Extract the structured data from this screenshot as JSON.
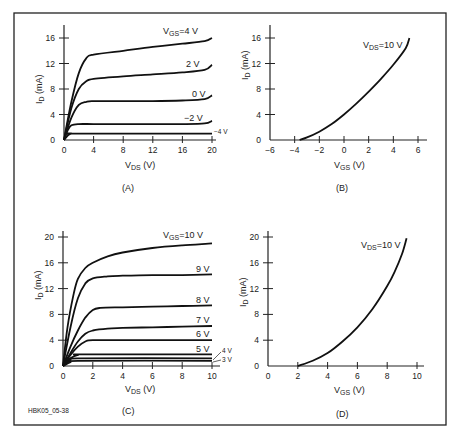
{
  "figure": {
    "credit": "HBK05_05-38",
    "border_color": "#222222"
  },
  "chart_data": [
    {
      "panel": "A",
      "type": "line",
      "caption": "(A)",
      "xlabel": "V_DS (V)",
      "ylabel": "I_D (mA)",
      "xticks": [
        0,
        4,
        8,
        12,
        16,
        20
      ],
      "yticks": [
        0,
        4,
        8,
        12,
        16
      ],
      "xlim": [
        0,
        20
      ],
      "ylim": [
        0,
        18
      ],
      "grid": false,
      "series": [
        {
          "name": "V_GS=4 V",
          "label": "V GS=4 V",
          "x": [
            0,
            1,
            2,
            3,
            4,
            8,
            12,
            16,
            19,
            20
          ],
          "y": [
            0,
            6,
            10.5,
            12.8,
            13.4,
            14,
            14.6,
            15.1,
            15.5,
            16
          ]
        },
        {
          "name": "2 V",
          "label": "2 V",
          "x": [
            0,
            1,
            2,
            3,
            4,
            8,
            12,
            16,
            19,
            20
          ],
          "y": [
            0,
            5,
            8,
            9.2,
            9.6,
            10,
            10.3,
            10.6,
            11,
            11.8
          ]
        },
        {
          "name": "0 V",
          "label": "0 V",
          "x": [
            0,
            1,
            2,
            3,
            4,
            8,
            12,
            16,
            19,
            20
          ],
          "y": [
            0,
            3.5,
            5.5,
            6,
            6.1,
            6.1,
            6.1,
            6.2,
            6.4,
            7
          ]
        },
        {
          "name": "-2 V",
          "label": "−2 V",
          "x": [
            0,
            0.5,
            1,
            2,
            4,
            8,
            12,
            16,
            19,
            20
          ],
          "y": [
            0,
            1.5,
            2.3,
            2.5,
            2.5,
            2.5,
            2.5,
            2.5,
            2.6,
            3
          ]
        },
        {
          "name": "-4 V",
          "label": "−4 V",
          "x": [
            0,
            0.5,
            1,
            2,
            20
          ],
          "y": [
            0,
            0.7,
            1,
            1,
            1
          ]
        }
      ]
    },
    {
      "panel": "B",
      "type": "line",
      "caption": "(B)",
      "xlabel": "V_GS (V)",
      "ylabel": "I_D (mA)",
      "xticks": [
        -6,
        -4,
        -2,
        0,
        2,
        4,
        6
      ],
      "yticks": [
        0,
        4,
        8,
        12,
        16
      ],
      "xlim": [
        -6,
        6.5
      ],
      "ylim": [
        0,
        18
      ],
      "grid": false,
      "series": [
        {
          "name": "V_DS=10 V",
          "label": "V DS=10 V",
          "x": [
            -3.6,
            -3,
            -2,
            -1,
            0,
            1,
            2,
            3,
            4,
            5,
            5.3
          ],
          "y": [
            0,
            0.4,
            1.3,
            2.5,
            4,
            5.7,
            7.6,
            9.6,
            11.8,
            14.4,
            16
          ]
        }
      ]
    },
    {
      "panel": "C",
      "type": "line",
      "caption": "(C)",
      "xlabel": "V_DS (V)",
      "ylabel": "I_D (mA)",
      "xticks": [
        0,
        2,
        4,
        6,
        8,
        10
      ],
      "yticks": [
        0,
        4,
        8,
        12,
        16,
        20
      ],
      "xlim": [
        0,
        10.5
      ],
      "ylim": [
        0,
        21
      ],
      "grid": false,
      "series": [
        {
          "name": "V_GS=10 V",
          "label": "V GS=10 V",
          "x": [
            0,
            0.3,
            0.7,
            1,
            1.5,
            2,
            3,
            4,
            6,
            8,
            10
          ],
          "y": [
            0,
            6,
            11,
            13.5,
            15.2,
            16,
            17,
            17.6,
            18.3,
            18.7,
            19
          ]
        },
        {
          "name": "9 V",
          "label": "9 V",
          "x": [
            0,
            0.5,
            1,
            1.5,
            2,
            3,
            4,
            6,
            8,
            10
          ],
          "y": [
            0,
            6,
            10.5,
            12.8,
            13.6,
            13.9,
            14,
            14.1,
            14.1,
            14.2
          ]
        },
        {
          "name": "8 V",
          "label": "8 V",
          "x": [
            0,
            0.5,
            1,
            1.5,
            2,
            2.5,
            4,
            6,
            8,
            10
          ],
          "y": [
            0,
            3,
            5.5,
            7.5,
            8.7,
            9,
            9.1,
            9.2,
            9.3,
            9.4
          ]
        },
        {
          "name": "7 V",
          "label": "7 V",
          "x": [
            0,
            0.5,
            1,
            1.5,
            2,
            3,
            4,
            6,
            8,
            10
          ],
          "y": [
            0,
            2,
            3.8,
            5,
            5.5,
            5.8,
            5.9,
            6,
            6.1,
            6.2
          ]
        },
        {
          "name": "6 V",
          "label": "6 V",
          "x": [
            0,
            0.5,
            1,
            1.5,
            2,
            4,
            6,
            8,
            10
          ],
          "y": [
            0,
            1.7,
            3,
            3.8,
            4,
            4,
            4,
            4,
            4
          ]
        },
        {
          "name": "5 V",
          "label": "5 V",
          "x": [
            0,
            0.5,
            1,
            1.5,
            10
          ],
          "y": [
            0,
            1.2,
            1.7,
            1.8,
            1.8
          ]
        },
        {
          "name": "4 V",
          "label": "4 V",
          "x": [
            0,
            0.5,
            1,
            10
          ],
          "y": [
            0,
            0.9,
            1.2,
            1.2
          ]
        },
        {
          "name": "3 V",
          "label": "3 V",
          "x": [
            0,
            0.5,
            1,
            10
          ],
          "y": [
            0,
            0.6,
            0.8,
            0.8
          ]
        }
      ]
    },
    {
      "panel": "D",
      "type": "line",
      "caption": "(D)",
      "xlabel": "V_GS (V)",
      "ylabel": "I_D (mA)",
      "xticks": [
        0,
        2,
        4,
        6,
        8,
        10
      ],
      "yticks": [
        0,
        4,
        8,
        12,
        16,
        20
      ],
      "xlim": [
        0,
        10.5
      ],
      "ylim": [
        0,
        21
      ],
      "grid": false,
      "series": [
        {
          "name": "V_DS=10 V",
          "label": "V DS=10 V",
          "x": [
            2,
            3,
            4,
            5,
            6,
            7,
            8,
            8.5,
            9,
            9.3
          ],
          "y": [
            0,
            0.8,
            2,
            3.8,
            6,
            8.8,
            12.4,
            14.6,
            17.4,
            19.8
          ]
        }
      ]
    }
  ],
  "labels": {
    "A": {
      "vgs_prefix": "V",
      "vgs_sub": "GS",
      "vgs_val": "=4 V",
      "l2": "2 V",
      "l0": "0 V",
      "lm2": "−2 V",
      "lm4": "−4 V"
    },
    "B": {
      "vds_prefix": "V",
      "vds_sub": "DS",
      "vds_val": "=10 V"
    },
    "C": {
      "vgs_prefix": "V",
      "vgs_sub": "GS",
      "vgs_val": "=10 V",
      "l9": "9 V",
      "l8": "8 V",
      "l7": "7 V",
      "l6": "6 V",
      "l5": "5 V",
      "l4": "4 V",
      "l3": "3 V"
    },
    "D": {
      "vds_prefix": "V",
      "vds_sub": "DS",
      "vds_val": "=10 V"
    },
    "xlabel_ds": {
      "main": "V",
      "sub": "DS",
      "unit": " (V)"
    },
    "xlabel_gs": {
      "main": "V",
      "sub": "GS",
      "unit": " (V)"
    },
    "ylabel": {
      "main": "I",
      "sub": "D",
      "unit": " (mA)"
    }
  }
}
